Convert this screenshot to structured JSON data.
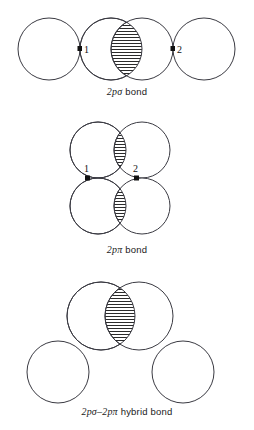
{
  "page": {
    "background_color": "#ffffff",
    "stroke_color": "#3a3a42",
    "hatch_color": "#2b2b2b",
    "width": 254,
    "height": 430
  },
  "figures": [
    {
      "id": "2p-sigma-bond",
      "caption_symbol": "2pσ",
      "caption_text": " bond",
      "caption_full": "2pσ bond",
      "node_labels": [
        "1",
        "2"
      ],
      "circle_count": 4,
      "overlap_regions": 1,
      "overlap_hatch": "horizontal"
    },
    {
      "id": "2p-pi-bond",
      "caption_symbol": "2pπ",
      "caption_text": " bond",
      "caption_full": "2pπ bond",
      "node_labels": [
        "1",
        "2"
      ],
      "circle_count": 4,
      "overlap_regions": 2,
      "overlap_hatch": "horizontal"
    },
    {
      "id": "2p-sigma-2p-pi-hybrid-bond",
      "caption_symbol_a": "2pσ",
      "caption_dash": "–",
      "caption_symbol_b": "2pπ",
      "caption_text": " hybrid bond",
      "caption_full": "2pσ–2pπ hybrid bond",
      "node_labels": [],
      "circle_count": 4,
      "overlap_regions": 1,
      "overlap_hatch": "horizontal"
    }
  ]
}
